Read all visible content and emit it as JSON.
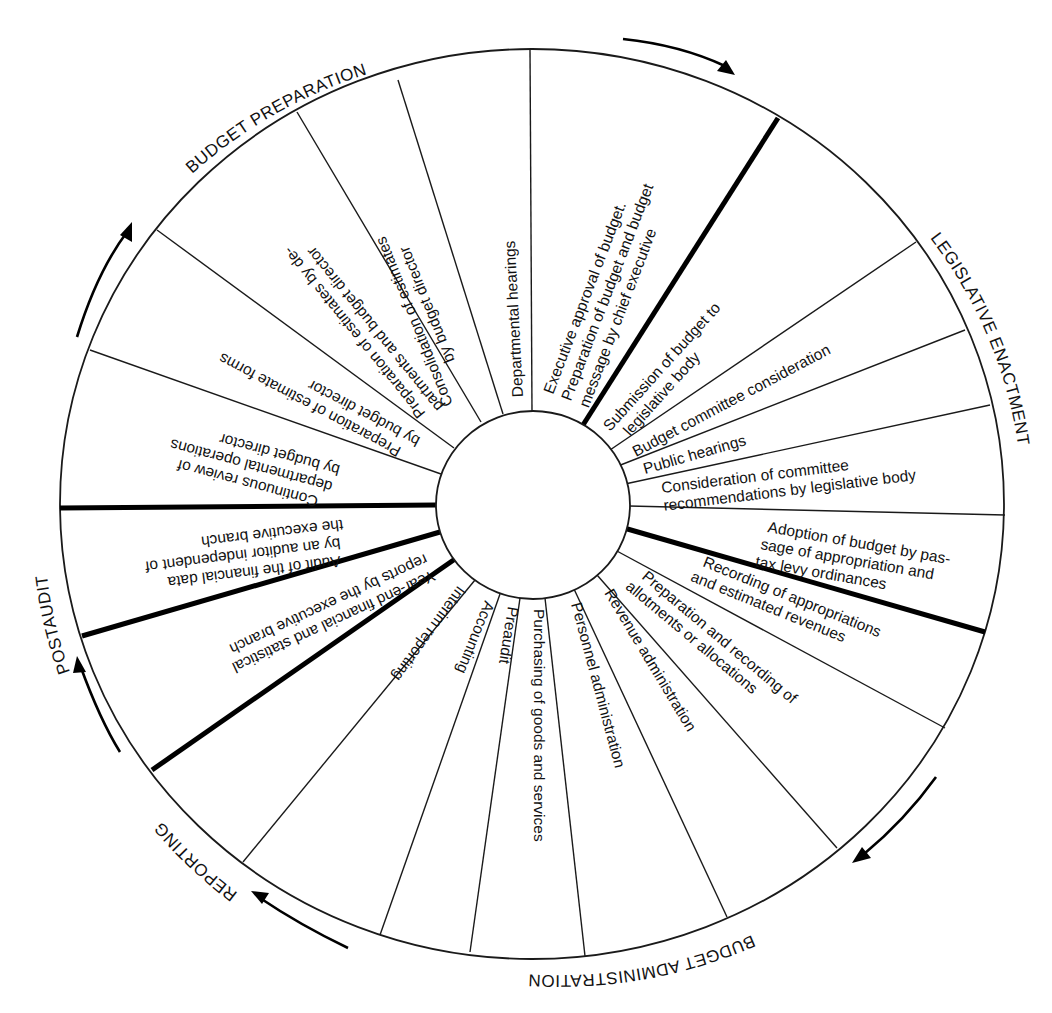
{
  "diagram": {
    "title": "",
    "type": "budget-cycle-wheel",
    "colors": {
      "line": "#1a1a1a",
      "background": "#ffffff"
    },
    "phases": [
      {
        "id": "budget_preparation",
        "label": "BUDGET PREPARATION"
      },
      {
        "id": "legislative_enactment",
        "label": "LEGISLATIVE ENACTMENT"
      },
      {
        "id": "budget_administration",
        "label": "BUDGET ADMINISTRATION"
      },
      {
        "id": "reporting",
        "label": "REPORTING"
      },
      {
        "id": "postaudit",
        "label": "POSTAUDIT"
      }
    ],
    "segments": [
      {
        "phase": "budget_preparation",
        "lines": [
          "Executive approval of budget.",
          "Preparation of budget and budget",
          "message by chief executive"
        ]
      },
      {
        "phase": "legislative_enactment",
        "lines": [
          "Submission of budget to",
          "legislative body"
        ]
      },
      {
        "phase": "legislative_enactment",
        "lines": [
          "Budget committee consideration"
        ]
      },
      {
        "phase": "legislative_enactment",
        "lines": [
          "Public hearings"
        ]
      },
      {
        "phase": "legislative_enactment",
        "lines": [
          "Consideration of committee",
          "recommendations by legislative body"
        ]
      },
      {
        "phase": "legislative_enactment",
        "lines": [
          "Adoption of budget by pas-",
          "sage of appropriation and",
          "tax levy ordinances"
        ]
      },
      {
        "phase": "budget_administration",
        "lines": [
          "Recording of appropriations",
          "and estimated revenues"
        ]
      },
      {
        "phase": "budget_administration",
        "lines": [
          "Preparation and recording of",
          "allotments or allocations"
        ]
      },
      {
        "phase": "budget_administration",
        "lines": [
          "Revenue administration"
        ]
      },
      {
        "phase": "budget_administration",
        "lines": [
          "Personnel administration"
        ]
      },
      {
        "phase": "budget_administration",
        "lines": [
          "Purchasing of goods and services"
        ]
      },
      {
        "phase": "budget_administration",
        "lines": [
          "Preaudit"
        ]
      },
      {
        "phase": "budget_administration",
        "lines": [
          "Accounting"
        ]
      },
      {
        "phase": "reporting",
        "lines": [
          "Interim reporting"
        ]
      },
      {
        "phase": "reporting",
        "lines": [
          "Year-end financial and statistical",
          "reports by the executive branch"
        ]
      },
      {
        "phase": "postaudit",
        "lines": [
          "Audit of the financial data",
          "by an auditor independent of",
          "the executive branch"
        ]
      },
      {
        "phase": "budget_preparation",
        "lines": [
          "Continuous review of",
          "departmental operations",
          "by budget director"
        ]
      },
      {
        "phase": "budget_preparation",
        "lines": [
          "Preparation  of estimate forms",
          "by budget director"
        ]
      },
      {
        "phase": "budget_preparation",
        "lines": [
          "Preparation of estimates by de-",
          "partments and budget director"
        ]
      },
      {
        "phase": "budget_preparation",
        "lines": [
          "Consolidation of estimates",
          "by budget director"
        ]
      },
      {
        "phase": "budget_preparation",
        "lines": [
          "Departmental hearings"
        ]
      }
    ],
    "flow_direction": "clockwise"
  }
}
